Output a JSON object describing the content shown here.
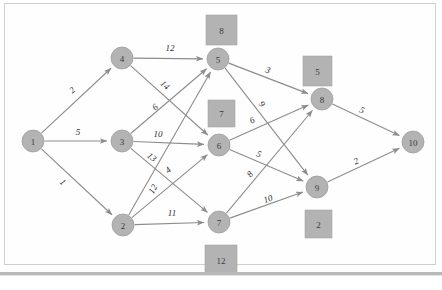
{
  "diagram": {
    "type": "network-graph",
    "colors": {
      "node_fill": "#b3b3b3",
      "node_stroke": "#9a9a9a",
      "edge_stroke": "#8c8c8c",
      "box_fill": "#b3b3b3",
      "text": "#2e2e2e",
      "background": "#ffffff",
      "frame_border": "#cfcfcf"
    },
    "nodes": [
      {
        "id": "1",
        "label": "1",
        "x": 33,
        "y": 141,
        "r": 11
      },
      {
        "id": "2",
        "label": "2",
        "x": 123,
        "y": 225,
        "r": 11
      },
      {
        "id": "3",
        "label": "3",
        "x": 122,
        "y": 141,
        "r": 11
      },
      {
        "id": "4",
        "label": "4",
        "x": 122,
        "y": 58,
        "r": 11
      },
      {
        "id": "5",
        "label": "5",
        "x": 218,
        "y": 59,
        "r": 11
      },
      {
        "id": "6",
        "label": "6",
        "x": 219,
        "y": 145,
        "r": 11
      },
      {
        "id": "7",
        "label": "7",
        "x": 219,
        "y": 222,
        "r": 11
      },
      {
        "id": "8",
        "label": "8",
        "x": 322,
        "y": 99,
        "r": 11
      },
      {
        "id": "9",
        "label": "9",
        "x": 317,
        "y": 187,
        "r": 11
      },
      {
        "id": "10",
        "label": "10",
        "x": 413,
        "y": 142,
        "r": 11
      }
    ],
    "edges": [
      {
        "from": "1",
        "to": "4",
        "weight": "2",
        "lx": 72,
        "ly": 90
      },
      {
        "from": "1",
        "to": "3",
        "weight": "5",
        "lx": 78,
        "ly": 132
      },
      {
        "from": "1",
        "to": "2",
        "weight": "1",
        "lx": 63,
        "ly": 182
      },
      {
        "from": "4",
        "to": "5",
        "weight": "12",
        "lx": 170,
        "ly": 48
      },
      {
        "from": "4",
        "to": "6",
        "weight": "14",
        "lx": 165,
        "ly": 85
      },
      {
        "from": "3",
        "to": "5",
        "weight": "6",
        "lx": 155,
        "ly": 107
      },
      {
        "from": "3",
        "to": "6",
        "weight": "10",
        "lx": 158,
        "ly": 134
      },
      {
        "from": "3",
        "to": "7",
        "weight": "13",
        "lx": 152,
        "ly": 157
      },
      {
        "from": "2",
        "to": "5",
        "weight": "12",
        "lx": 153,
        "ly": 189
      },
      {
        "from": "2",
        "to": "6",
        "weight": "4",
        "lx": 168,
        "ly": 170
      },
      {
        "from": "2",
        "to": "7",
        "weight": "11",
        "lx": 172,
        "ly": 213
      },
      {
        "from": "5",
        "to": "8",
        "weight": "3",
        "lx": 268,
        "ly": 70
      },
      {
        "from": "5",
        "to": "9",
        "weight": "9",
        "lx": 262,
        "ly": 104
      },
      {
        "from": "6",
        "to": "8",
        "weight": "6",
        "lx": 252,
        "ly": 120
      },
      {
        "from": "6",
        "to": "9",
        "weight": "5",
        "lx": 259,
        "ly": 154
      },
      {
        "from": "7",
        "to": "8",
        "weight": "8",
        "lx": 250,
        "ly": 174
      },
      {
        "from": "7",
        "to": "9",
        "weight": "10",
        "lx": 268,
        "ly": 199
      },
      {
        "from": "8",
        "to": "10",
        "weight": "5",
        "lx": 362,
        "ly": 110
      },
      {
        "from": "9",
        "to": "10",
        "weight": "2",
        "lx": 356,
        "ly": 161
      }
    ],
    "boxes": [
      {
        "id": "box-8",
        "label": "8",
        "x": 206,
        "y": 15,
        "w": 31,
        "h": 30
      },
      {
        "id": "box-5",
        "label": "5",
        "x": 303,
        "y": 56,
        "w": 29,
        "h": 30
      },
      {
        "id": "box-7",
        "label": "7",
        "x": 208,
        "y": 100,
        "w": 27,
        "h": 27
      },
      {
        "id": "box-2",
        "label": "2",
        "x": 305,
        "y": 210,
        "w": 27,
        "h": 28
      },
      {
        "id": "box-12",
        "label": "12",
        "x": 205,
        "y": 245,
        "w": 32,
        "h": 30
      }
    ]
  }
}
